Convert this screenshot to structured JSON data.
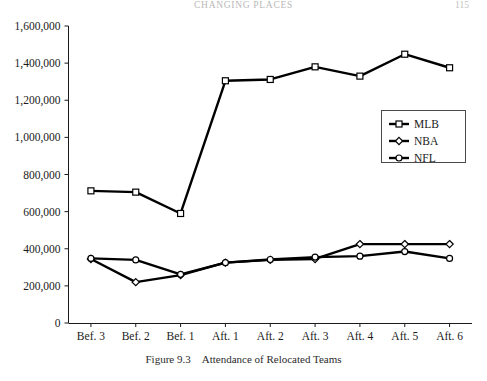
{
  "running_head": {
    "title": "CHANGING PLACES",
    "page": "115"
  },
  "caption": {
    "number": "Figure 9.3",
    "text": "Attendance of Relocated Teams"
  },
  "chart_data": {
    "type": "line",
    "title": "Attendance of Relocated Teams",
    "xlabel": "",
    "ylabel": "",
    "categories": [
      "Bef. 3",
      "Bef. 2",
      "Bef. 1",
      "Aft. 1",
      "Aft. 2",
      "Aft. 3",
      "Aft. 4",
      "Aft. 5",
      "Aft. 6"
    ],
    "ylim": [
      0,
      1600000
    ],
    "ytick_values": [
      0,
      200000,
      400000,
      600000,
      800000,
      1000000,
      1200000,
      1400000,
      1600000
    ],
    "ytick_labels": [
      "0",
      "200,000",
      "400,000",
      "600,000",
      "800,000",
      "1,000,000",
      "1,200,000",
      "1,400,000",
      "1,600,000"
    ],
    "grid": false,
    "legend_position": "center right",
    "series": [
      {
        "name": "MLB",
        "marker": "square",
        "color": "#000000",
        "values": [
          712000,
          705000,
          590000,
          1305000,
          1312000,
          1380000,
          1330000,
          1448000,
          1375000
        ]
      },
      {
        "name": "NBA",
        "marker": "diamond",
        "color": "#000000",
        "values": [
          345000,
          220000,
          258000,
          325000,
          340000,
          345000,
          425000,
          425000,
          425000
        ]
      },
      {
        "name": "NFL",
        "marker": "circle",
        "color": "#000000",
        "values": [
          348000,
          340000,
          262000,
          325000,
          342000,
          355000,
          360000,
          385000,
          348000
        ]
      }
    ]
  },
  "legend": {
    "items": [
      {
        "label": "MLB"
      },
      {
        "label": "NBA"
      },
      {
        "label": "NFL"
      }
    ]
  },
  "axes": {
    "y_labels": [
      "1,600,000",
      "1,400,000",
      "1,200,000",
      "1,000,000",
      "800,000",
      "600,000",
      "400,000",
      "200,000",
      "0"
    ],
    "x_labels": [
      "Bef. 3",
      "Bef. 2",
      "Bef. 1",
      "Aft. 1",
      "Aft. 2",
      "Aft. 3",
      "Aft. 4",
      "Aft. 5",
      "Aft. 6"
    ]
  }
}
